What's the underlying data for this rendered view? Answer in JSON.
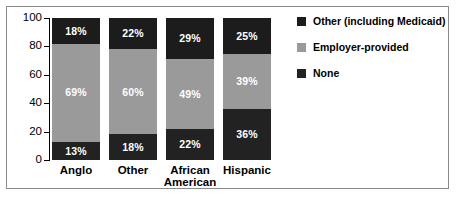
{
  "chart_data": {
    "type": "bar",
    "subtype": "stacked-bar-100",
    "title": "",
    "xlabel": "",
    "ylabel": "",
    "ylim": [
      0,
      100
    ],
    "yticks": [
      0,
      20,
      40,
      60,
      80,
      100
    ],
    "ytick_labels": [
      "0",
      "20",
      "40",
      "60",
      "80",
      "100"
    ],
    "grid": false,
    "legend_position": "right",
    "categories": [
      "Anglo",
      "Other",
      "African American",
      "Hispanic"
    ],
    "category_lines": [
      [
        "Anglo"
      ],
      [
        "Other"
      ],
      [
        "African",
        "American"
      ],
      [
        "Hispanic"
      ]
    ],
    "series": [
      {
        "name": "None",
        "color": "#222222",
        "values": [
          13,
          18,
          22,
          36
        ],
        "labels": [
          "13%",
          "18%",
          "22%",
          "36%"
        ]
      },
      {
        "name": "Employer-provided",
        "color": "#9a9a9a",
        "values": [
          69,
          60,
          49,
          39
        ],
        "labels": [
          "69%",
          "60%",
          "49%",
          "39%"
        ]
      },
      {
        "name": "Other (including Medicaid)",
        "color": "#1c1c1c",
        "values": [
          18,
          22,
          29,
          25
        ],
        "labels": [
          "18%",
          "22%",
          "29%",
          "25%"
        ]
      }
    ],
    "legend": [
      {
        "label": "Other (including Medicaid)",
        "color": "#1c1c1c"
      },
      {
        "label": "Employer-provided",
        "color": "#9a9a9a"
      },
      {
        "label": "None",
        "color": "#222222"
      }
    ]
  }
}
